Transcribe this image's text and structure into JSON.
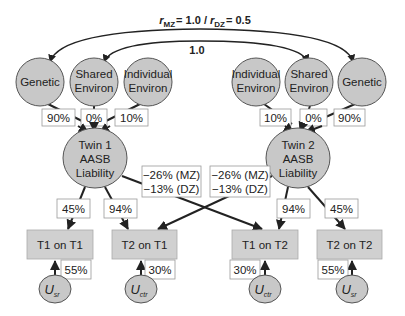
{
  "title": {
    "r_symbol": "r",
    "mz_sub": "MZ",
    "mz_value": "= 1.0 / ",
    "dz_sub": "DZ",
    "dz_value": "= 0.5"
  },
  "shared_correlation_label": "1.0",
  "colors": {
    "node_fill": "#c8c8c8",
    "node_stroke": "#555555",
    "box_fill": "#d0d0d0",
    "label_box_fill": "#ffffff",
    "label_box_stroke": "#999999",
    "line": "#222222"
  },
  "twin1": {
    "latents": [
      {
        "line1": "Genetic",
        "line2": "",
        "path": "90%"
      },
      {
        "line1": "Shared",
        "line2": "Environ",
        "path": "0%"
      },
      {
        "line1": "Individual",
        "line2": "Environ",
        "path": "10%"
      }
    ],
    "liability": {
      "line1": "Twin 1",
      "line2": "AASB",
      "line3": "Liability"
    },
    "self_path": "45%",
    "cross_path_own": "94%",
    "cross_effect": {
      "line1": "−26% (MZ)",
      "line2": "−13% (DZ)"
    },
    "outcomes": [
      {
        "label": "T1 on T1",
        "residual": "55%",
        "u_main": "U",
        "u_sub": "sr"
      },
      {
        "label": "T2 on T1",
        "residual": "30%",
        "u_main": "U",
        "u_sub": "ctr"
      }
    ]
  },
  "twin2": {
    "latents": [
      {
        "line1": "Individual",
        "line2": "Environ",
        "path": "10%"
      },
      {
        "line1": "Shared",
        "line2": "Environ",
        "path": "0%"
      },
      {
        "line1": "Genetic",
        "line2": "",
        "path": "90%"
      }
    ],
    "liability": {
      "line1": "Twin 2",
      "line2": "AASB",
      "line3": "Liability"
    },
    "self_path": "45%",
    "cross_path_own": "94%",
    "cross_effect": {
      "line1": "−26% (MZ)",
      "line2": "−13% (DZ)"
    },
    "outcomes": [
      {
        "label": "T1 on T2",
        "residual": "30%",
        "u_main": "U",
        "u_sub": "ctr"
      },
      {
        "label": "T2 on T2",
        "residual": "55%",
        "u_main": "U",
        "u_sub": "sr"
      }
    ]
  }
}
